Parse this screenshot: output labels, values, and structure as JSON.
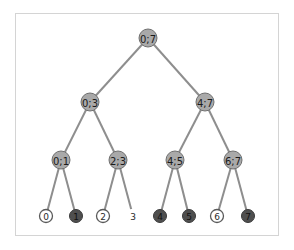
{
  "diagram": {
    "type": "binary-tree",
    "frame": {
      "left": 15,
      "top": 13,
      "width": 264,
      "height": 223,
      "border": "#d4d4d4"
    },
    "colors": {
      "edge": "#8e8e8e",
      "internal_fill": "#a9a9a9",
      "leaf_light_fill": "#ffffff",
      "leaf_dark_fill": "#4f4f4f"
    },
    "nodes": {
      "root": {
        "label": "0;7",
        "x": 148,
        "y": 38
      },
      "n03": {
        "label": "0;3",
        "x": 90,
        "y": 102
      },
      "n47": {
        "label": "4;7",
        "x": 205,
        "y": 102
      },
      "n01": {
        "label": "0;1",
        "x": 61,
        "y": 160
      },
      "n23": {
        "label": "2;3",
        "x": 118,
        "y": 160
      },
      "n45": {
        "label": "4;5",
        "x": 175,
        "y": 160
      },
      "n67": {
        "label": "6;7",
        "x": 233,
        "y": 160
      },
      "l0": {
        "label": "0",
        "x": 46,
        "y": 216,
        "style": "light"
      },
      "l1": {
        "label": "1",
        "x": 76,
        "y": 216,
        "style": "dark"
      },
      "l2": {
        "label": "2",
        "x": 103,
        "y": 216,
        "style": "light"
      },
      "l3": {
        "label": "3",
        "x": 133,
        "y": 216,
        "style": "light"
      },
      "l4": {
        "label": "4",
        "x": 160,
        "y": 216,
        "style": "dark"
      },
      "l5": {
        "label": "5",
        "x": 189,
        "y": 216,
        "style": "dark"
      },
      "l6": {
        "label": "6",
        "x": 217,
        "y": 216,
        "style": "light"
      },
      "l7": {
        "label": "7",
        "x": 248,
        "y": 216,
        "style": "dark"
      }
    },
    "edges": [
      [
        "root",
        "n03"
      ],
      [
        "root",
        "n47"
      ],
      [
        "n03",
        "n01"
      ],
      [
        "n03",
        "n23"
      ],
      [
        "n47",
        "n45"
      ],
      [
        "n47",
        "n67"
      ],
      [
        "n01",
        "l0"
      ],
      [
        "n01",
        "l1"
      ],
      [
        "n23",
        "l2"
      ],
      [
        "n23",
        "l3"
      ],
      [
        "n45",
        "l4"
      ],
      [
        "n45",
        "l5"
      ],
      [
        "n67",
        "l6"
      ],
      [
        "n67",
        "l7"
      ]
    ]
  }
}
